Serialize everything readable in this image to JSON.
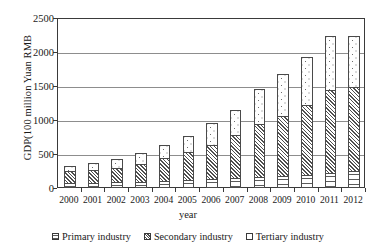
{
  "chart_data": {
    "type": "bar",
    "title": "",
    "subtitle": "",
    "stacked": true,
    "xlabel": "year",
    "ylabel": "GDP(100 million Yuan RMB",
    "ylim": [
      0,
      2500
    ],
    "ytick_step": 500,
    "yticks": [
      0,
      500,
      1000,
      1500,
      2000,
      2500
    ],
    "ytick_labels": [
      "0",
      "500",
      "1000",
      "1500",
      "2000",
      "2500"
    ],
    "grid": "horizontal",
    "legend_position": "bottom",
    "categories": [
      "2000",
      "2001",
      "2002",
      "2003",
      "2004",
      "2005",
      "2006",
      "2007",
      "2008",
      "2009",
      "2010",
      "2011",
      "2012"
    ],
    "series": [
      {
        "name": "Primary industry",
        "pattern": "horizontal-lines",
        "values": [
          75,
          80,
          85,
          95,
          110,
          120,
          130,
          140,
          165,
          175,
          195,
          225,
          250
        ]
      },
      {
        "name": "Secondary industry",
        "pattern": "diagonal-hatch",
        "values": [
          185,
          205,
          230,
          280,
          340,
          425,
          520,
          660,
          790,
          900,
          1040,
          1230,
          1250
        ]
      },
      {
        "name": "Tertiary industry",
        "pattern": "dots",
        "values": [
          100,
          115,
          135,
          175,
          215,
          245,
          330,
          370,
          525,
          625,
          715,
          815,
          770
        ]
      }
    ],
    "totals": [
      360,
      400,
      450,
      550,
      665,
      790,
      980,
      1170,
      1480,
      1700,
      1950,
      2270,
      2270
    ]
  },
  "axis": {
    "x_title": "year",
    "y_title": "GDP(100 million Yuan RMB"
  },
  "legend": {
    "items": [
      {
        "label": "Primary industry",
        "pattern": "primary"
      },
      {
        "label": "Secondary industry",
        "pattern": "secondary"
      },
      {
        "label": "Tertiary industry",
        "pattern": "tertiary"
      }
    ]
  }
}
